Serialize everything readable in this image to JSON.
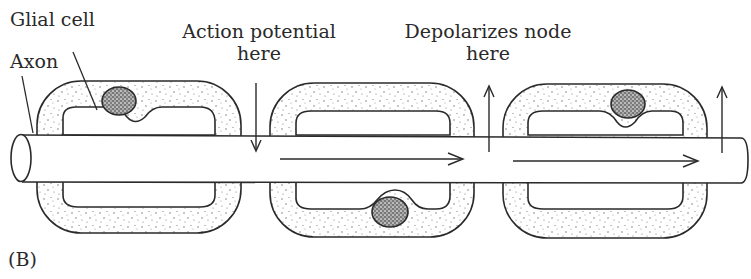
{
  "figure": {
    "panel_label": "(B)",
    "labels": {
      "glial_cell": "Glial cell",
      "axon": "Axon",
      "action_potential_line1": "Action potential",
      "action_potential_line2": "here",
      "depolarizes_line1": "Depolarizes node",
      "depolarizes_line2": "here"
    },
    "segments": [
      {
        "name": "segment-1",
        "nucleus_position": "top"
      },
      {
        "name": "segment-2",
        "nucleus_position": "bottom"
      },
      {
        "name": "segment-3",
        "nucleus_position": "top"
      }
    ],
    "colors": {
      "stroke": "#2a2a2a",
      "stipple": "#555555",
      "background": "#ffffff"
    }
  }
}
